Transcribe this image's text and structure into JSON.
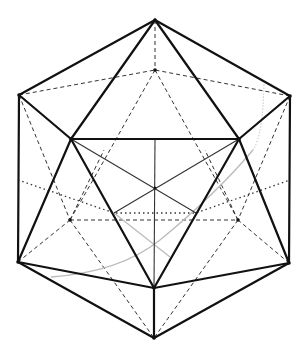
{
  "diagram": {
    "title": "Icosahedron wireframe",
    "subject": "icosahedron",
    "vertex_count": 12,
    "edge_count": 30,
    "face_count": 20,
    "line_styles": {
      "front_edge": "solid-bold",
      "hidden_edge": "dashed",
      "construction_line": "solid-thin",
      "section_line": "dotted",
      "guide_curve": "solid-light-gray"
    },
    "colors": {
      "background": "#ffffff",
      "edge": "#111111",
      "hidden": "#333333",
      "guide": "#bbbbbb"
    }
  }
}
